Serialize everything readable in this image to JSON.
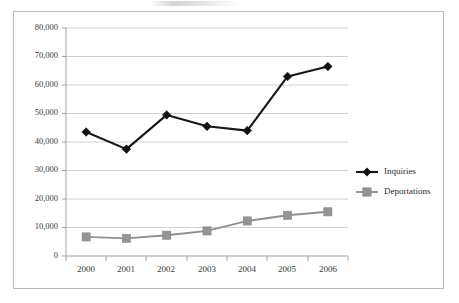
{
  "chart_data": {
    "type": "line",
    "title": "",
    "xlabel": "",
    "ylabel": "",
    "categories": [
      "2000",
      "2001",
      "2002",
      "2003",
      "2004",
      "2005",
      "2006"
    ],
    "series": [
      {
        "name": "Inquiries",
        "color": "#121212",
        "marker": "diamond",
        "values": [
          43500,
          37500,
          49500,
          45500,
          44000,
          63000,
          66500
        ]
      },
      {
        "name": "Deportations",
        "color": "#949494",
        "marker": "square",
        "values": [
          6700,
          6200,
          7300,
          8800,
          12300,
          14300,
          15500
        ]
      }
    ],
    "ylim": [
      0,
      80000
    ],
    "ytick_values": [
      0,
      10000,
      20000,
      30000,
      40000,
      50000,
      60000,
      70000,
      80000
    ],
    "ytick_labels": [
      "0",
      "10,000",
      "20,000",
      "30,000",
      "40,000",
      "50,000",
      "60,000",
      "70,000",
      "80,000"
    ],
    "grid": true,
    "grid_axis": "y",
    "legend_position": "right",
    "legend": [
      "Inquiries",
      "Deportations"
    ],
    "annotations": []
  },
  "frame": {
    "border_color": "#b9b9b9",
    "background": "#ffffff"
  },
  "legend_items": [
    {
      "label": "Inquiries",
      "color": "#121212",
      "marker": "diamond"
    },
    {
      "label": "Deportations",
      "color": "#949494",
      "marker": "square"
    }
  ]
}
